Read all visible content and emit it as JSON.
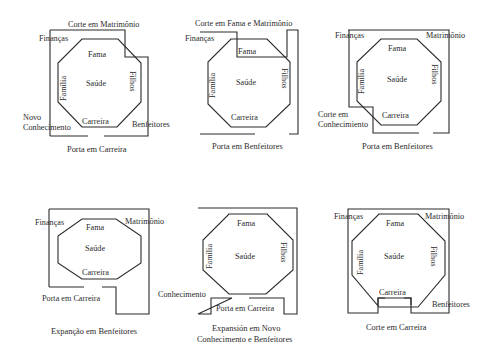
{
  "diagrams": [
    {
      "caption": [
        "Porta em Carreira"
      ],
      "labels": {
        "top": "Corte em Matrimônio",
        "fin": "Finanças",
        "fama": "Fama",
        "saude": "Saúde",
        "familia": "Família",
        "filhos": "Filhos",
        "carreira": "Carreira",
        "ext1": "Novo",
        "ext2": "Conhecimento",
        "ben": "Benfeitores"
      }
    },
    {
      "caption": [
        "Porta em Benfeitores"
      ],
      "labels": {
        "top": "Corte em Fama e Matrimônio",
        "fin": "Finanças",
        "fama": "Fama",
        "saude": "Saúde",
        "familia": "Família",
        "filhos": "Filhos",
        "carreira": "Carreira"
      }
    },
    {
      "caption": [
        "Porta em Benfeitores"
      ],
      "labels": {
        "fin": "Finanças",
        "mat": "Matrimônio",
        "fama": "Fama",
        "saude": "Saúde",
        "familia": "Família",
        "filhos": "Filhos",
        "carreira": "Carreira",
        "ext1": "Corte em",
        "ext2": "Conhecimiento"
      }
    },
    {
      "caption": [
        "Expanção em Benfeitores"
      ],
      "labels": {
        "fin": "Finanças",
        "mat": "Matrimônio",
        "fama": "Fama",
        "saude": "Saúde",
        "carreira": "Carreira",
        "porta": "Porta em Carreira"
      }
    },
    {
      "caption": [
        "Expansión em Novo",
        "Conhecimento e Benfeitores"
      ],
      "labels": {
        "fama": "Fama",
        "saude": "Saúde",
        "familia": "Família",
        "filhos": "Filhos",
        "con": "Conhecimento",
        "porta": "Porta em Carreira"
      }
    },
    {
      "caption": [
        "Corte em Carreira"
      ],
      "labels": {
        "fin": "Finanças",
        "mat": "Matrimônio",
        "fama": "Fama",
        "saude": "Saúde",
        "familia": "Família",
        "filhos": "Filhos",
        "carreira": "Carreira",
        "ben": "Benfeitores"
      }
    }
  ]
}
